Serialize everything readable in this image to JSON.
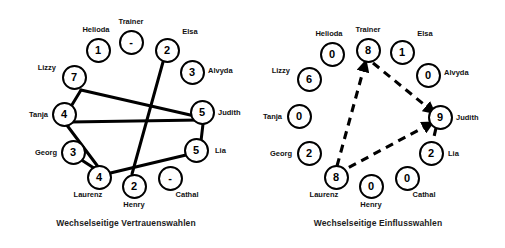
{
  "figure": {
    "width": 505,
    "height": 248,
    "background": "#ffffff",
    "stroke_color": "#000000",
    "text_color": "#111111"
  },
  "panels": [
    {
      "id": "vertrauenswahlen",
      "caption": "Wechselseitige Vertrauenswahlen",
      "edge_style": "solid",
      "nodes": [
        {
          "name": "Trainer",
          "value": "-",
          "cx": 131,
          "cy": 42,
          "label_pos": "above",
          "lx": 131,
          "ly": 26
        },
        {
          "name": "Helioda",
          "value": "1",
          "cx": 98,
          "cy": 50,
          "label_pos": "above",
          "lx": 96,
          "ly": 34
        },
        {
          "name": "Elsa",
          "value": "2",
          "cx": 167,
          "cy": 50,
          "label_pos": "above",
          "lx": 190,
          "ly": 36
        },
        {
          "name": "Lizzy",
          "value": "7",
          "cx": 74,
          "cy": 77,
          "label_pos": "left",
          "lx": 56,
          "ly": 67
        },
        {
          "name": "Alvyda",
          "value": "3",
          "cx": 192,
          "cy": 72,
          "label_pos": "right",
          "lx": 208,
          "ly": 70
        },
        {
          "name": "Tanja",
          "value": "4",
          "cx": 64,
          "cy": 114,
          "label_pos": "left",
          "lx": 48,
          "ly": 114
        },
        {
          "name": "Judith",
          "value": "5",
          "cx": 202,
          "cy": 112,
          "label_pos": "right",
          "lx": 218,
          "ly": 112
        },
        {
          "name": "Georg",
          "value": "3",
          "cx": 73,
          "cy": 152,
          "label_pos": "left",
          "lx": 57,
          "ly": 152
        },
        {
          "name": "Lia",
          "value": "5",
          "cx": 196,
          "cy": 150,
          "label_pos": "right",
          "lx": 215,
          "ly": 150
        },
        {
          "name": "Laurenz",
          "value": "4",
          "cx": 99,
          "cy": 177,
          "label_pos": "below",
          "lx": 88,
          "ly": 190
        },
        {
          "name": "Henry",
          "value": "2",
          "cx": 134,
          "cy": 186,
          "label_pos": "below",
          "lx": 134,
          "ly": 200
        },
        {
          "name": "Cathal",
          "value": "-",
          "cx": 170,
          "cy": 178,
          "label_pos": "below",
          "lx": 187,
          "ly": 190
        }
      ],
      "edges": [
        {
          "from": "Lizzy",
          "to": "Tanja",
          "d": "M 81 90 L 64 118"
        },
        {
          "from": "Lizzy",
          "to": "Judith",
          "d": "M 81 90 L 199 117"
        },
        {
          "from": "Tanja",
          "to": "Judith",
          "d": "M 70 122 L 200 120"
        },
        {
          "from": "Tanja",
          "to": "Laurenz",
          "d": "M 66 124 L 99 168"
        },
        {
          "from": "Georg",
          "to": "Laurenz",
          "d": "M 80 159 L 100 172"
        },
        {
          "from": "Elsa",
          "to": "Henry",
          "d": "M 163 62 L 132 174"
        },
        {
          "from": "Judith",
          "to": "Lia",
          "d": "M 203 124 L 201 141"
        },
        {
          "from": "Lia",
          "to": "Laurenz",
          "d": "M 186 155 L 102 175"
        }
      ]
    },
    {
      "id": "einflusswahlen",
      "caption": "Wechselseitige Einflusswahlen",
      "edge_style": "dashed",
      "nodes": [
        {
          "name": "Trainer",
          "value": "8",
          "cx": 116,
          "cy": 50,
          "label_pos": "above",
          "lx": 116,
          "ly": 34
        },
        {
          "name": "Helioda",
          "value": "0",
          "cx": 80,
          "cy": 54,
          "label_pos": "above",
          "lx": 77,
          "ly": 38
        },
        {
          "name": "Elsa",
          "value": "1",
          "cx": 150,
          "cy": 52,
          "label_pos": "above",
          "lx": 173,
          "ly": 38
        },
        {
          "name": "Lizzy",
          "value": "6",
          "cx": 57,
          "cy": 79,
          "label_pos": "left",
          "lx": 38,
          "ly": 70
        },
        {
          "name": "Alvyda",
          "value": "0",
          "cx": 176,
          "cy": 75,
          "label_pos": "right",
          "lx": 192,
          "ly": 72
        },
        {
          "name": "Tanja",
          "value": "0",
          "cx": 47,
          "cy": 116,
          "label_pos": "left",
          "lx": 30,
          "ly": 116
        },
        {
          "name": "Judith",
          "value": "9",
          "cx": 188,
          "cy": 117,
          "label_pos": "right",
          "lx": 204,
          "ly": 117
        },
        {
          "name": "Georg",
          "value": "2",
          "cx": 57,
          "cy": 153,
          "label_pos": "left",
          "lx": 40,
          "ly": 153
        },
        {
          "name": "Lia",
          "value": "2",
          "cx": 179,
          "cy": 153,
          "label_pos": "right",
          "lx": 196,
          "ly": 153
        },
        {
          "name": "Laurenz",
          "value": "8",
          "cx": 84,
          "cy": 177,
          "label_pos": "below",
          "lx": 72,
          "ly": 190
        },
        {
          "name": "Henry",
          "value": "0",
          "cx": 119,
          "cy": 186,
          "label_pos": "below",
          "lx": 119,
          "ly": 200
        },
        {
          "name": "Cathal",
          "value": "0",
          "cx": 155,
          "cy": 178,
          "label_pos": "below",
          "lx": 172,
          "ly": 190
        }
      ],
      "edges": [
        {
          "from": "Laurenz",
          "to": "Trainer",
          "d": "M 85 166 L 113 64",
          "arrow_end": true
        },
        {
          "from": "Trainer",
          "to": "Judith",
          "d": "M 121 63 L 180 111",
          "arrow_end": true
        },
        {
          "from": "Judith",
          "to": "Laurenz",
          "d": "M 178 124 L 92 170",
          "arrow_start": true
        },
        {
          "from": "Judith",
          "to": "Lia",
          "d": "M 184 128 L 181 141"
        }
      ]
    }
  ]
}
